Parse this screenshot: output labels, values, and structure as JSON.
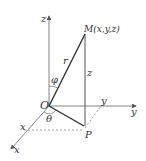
{
  "diagram": {
    "labels": {
      "z_axis": "z",
      "y_axis": "y",
      "x_axis": "x",
      "point_m": "M(x,y,z)",
      "r": "r",
      "phi": "φ",
      "z_height": "z",
      "origin": "O",
      "theta": "θ",
      "point_p": "P",
      "x_tick": "x",
      "y_tick": "y"
    },
    "colors": {
      "axis": "#666666",
      "segment": "#333333",
      "dashed": "#888888"
    }
  }
}
